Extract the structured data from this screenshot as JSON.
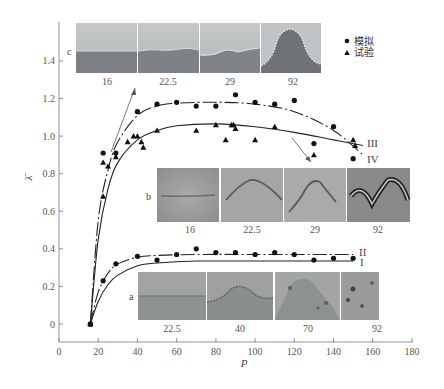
{
  "chart_data": {
    "type": "scatter",
    "title": "",
    "xlabel": "P",
    "ylabel": "λ̄",
    "xlim": [
      0,
      180
    ],
    "ylim": [
      -0.1,
      1.55
    ],
    "x_ticks": [
      0,
      20,
      40,
      60,
      80,
      100,
      120,
      140,
      160,
      180
    ],
    "y_ticks": [
      0,
      0.2,
      0.4,
      0.6,
      0.8,
      1.0,
      1.2,
      1.4
    ],
    "y_tick_labels": [
      "0",
      "0.2",
      "0.4",
      "0.6",
      "0.8",
      "1.0",
      "1.2",
      "1.4"
    ],
    "grid": false,
    "legend": {
      "position": "upper right",
      "entries": [
        {
          "marker": "circle",
          "label": "模拟"
        },
        {
          "marker": "triangle",
          "label": "试验"
        }
      ]
    },
    "series": [
      {
        "name": "模拟 (upper group)",
        "marker": "circle",
        "x": [
          16,
          22.5,
          29,
          40,
          50,
          60,
          70,
          80,
          90,
          100,
          110,
          120,
          130,
          140,
          150
        ],
        "y": [
          0.0,
          0.91,
          0.91,
          1.13,
          1.17,
          1.18,
          1.16,
          1.16,
          1.22,
          1.18,
          1.17,
          1.19,
          0.96,
          1.05,
          0.88
        ]
      },
      {
        "name": "试验 (upper group)",
        "marker": "triangle",
        "x": [
          16,
          22.5,
          22.5,
          25,
          29,
          35,
          38,
          40,
          42,
          43,
          50,
          70,
          80,
          85,
          88,
          89,
          90,
          100,
          110,
          130,
          150,
          151
        ],
        "y": [
          0.0,
          0.68,
          0.86,
          0.84,
          0.89,
          0.97,
          1.0,
          1.0,
          0.97,
          0.94,
          1.03,
          1.03,
          1.06,
          0.98,
          1.06,
          1.06,
          1.04,
          0.98,
          1.05,
          0.9,
          0.98,
          0.95
        ]
      },
      {
        "name": "模拟 (lower group)",
        "marker": "circle",
        "x": [
          16,
          22.5,
          29,
          40,
          50,
          60,
          70,
          80,
          90,
          100,
          110,
          120,
          130,
          140,
          150
        ],
        "y": [
          0.0,
          0.23,
          0.32,
          0.36,
          0.34,
          0.37,
          0.4,
          0.38,
          0.38,
          0.37,
          0.38,
          0.37,
          0.34,
          0.35,
          0.35
        ]
      }
    ],
    "curves": [
      {
        "name": "III",
        "style": "dash-dot",
        "description": "fit to 模拟 upper",
        "x": [
          16,
          20,
          25,
          30,
          40,
          50,
          60,
          80,
          100,
          120,
          140,
          155
        ],
        "y": [
          0.0,
          0.55,
          0.82,
          0.97,
          1.11,
          1.16,
          1.175,
          1.18,
          1.17,
          1.13,
          1.03,
          0.9
        ]
      },
      {
        "name": "IV",
        "style": "solid",
        "description": "fit to 试验 upper",
        "x": [
          16,
          20,
          25,
          30,
          40,
          50,
          60,
          80,
          100,
          120,
          140,
          155
        ],
        "y": [
          0.0,
          0.45,
          0.72,
          0.86,
          0.98,
          1.03,
          1.055,
          1.065,
          1.05,
          1.02,
          0.98,
          0.95
        ]
      },
      {
        "name": "II",
        "style": "dash-dot",
        "description": "fit to 模拟 lower",
        "x": [
          16,
          20,
          25,
          30,
          40,
          50,
          70,
          100,
          150
        ],
        "y": [
          0.0,
          0.17,
          0.27,
          0.32,
          0.355,
          0.365,
          0.37,
          0.37,
          0.37
        ]
      },
      {
        "name": "I",
        "style": "solid",
        "description": "lower solid",
        "x": [
          16,
          20,
          25,
          30,
          40,
          50,
          70,
          100,
          150
        ],
        "y": [
          0.0,
          0.12,
          0.21,
          0.26,
          0.31,
          0.325,
          0.335,
          0.335,
          0.335
        ]
      }
    ],
    "inset_panels": [
      {
        "row": "c",
        "labels": [
          "16",
          "22.5",
          "29",
          "92"
        ]
      },
      {
        "row": "b",
        "labels": [
          "16",
          "22.5",
          "29",
          "92"
        ]
      },
      {
        "row": "a",
        "labels": [
          "22.5",
          "40",
          "70",
          "92"
        ]
      }
    ],
    "annotations": [
      "I",
      "II",
      "III",
      "IV",
      "a",
      "b",
      "c"
    ]
  },
  "axes": {
    "x_label": "P",
    "y_label": "λ̄"
  },
  "legend": {
    "items": [
      {
        "symbol": "●",
        "label": "模拟"
      },
      {
        "symbol": "▲",
        "label": "试验"
      }
    ]
  },
  "curve_labels": {
    "I": "I",
    "II": "II",
    "III": "III",
    "IV": "IV"
  },
  "panels": {
    "c": {
      "label": "c",
      "captions": [
        "16",
        "22.5",
        "29",
        "92"
      ]
    },
    "b": {
      "label": "b",
      "captions": [
        "16",
        "22.5",
        "29",
        "92"
      ]
    },
    "a": {
      "label": "a",
      "captions": [
        "22.5",
        "40",
        "70",
        "92"
      ]
    }
  },
  "colors": {
    "axis": "#666666",
    "data": "#1a1a1a",
    "panel_c_top": "#b9bcbe",
    "panel_c_bottom": "#7d8185",
    "panel_b_bg": "#a8a8a6",
    "panel_a_bg": "#9a9c9c"
  }
}
